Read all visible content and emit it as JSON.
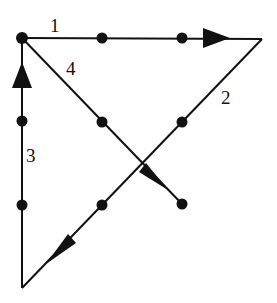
{
  "figure": {
    "canvas": {
      "width": 277,
      "height": 303,
      "background": "#ffffff"
    },
    "stroke_color": "#111111",
    "node_color": "#111111",
    "stroke_width": 2,
    "node_radius": 5.5,
    "vertices": [
      {
        "name": "top-left-vertex",
        "x": 22,
        "y": 38
      },
      {
        "name": "top-right-vertex",
        "x": 262,
        "y": 39
      },
      {
        "name": "bottom-left-vertex",
        "x": 22,
        "y": 288
      },
      {
        "name": "branch-end-vertex",
        "x": 182,
        "y": 204
      }
    ],
    "edges": [
      {
        "name": "edge-1-top",
        "label": "1",
        "from": {
          "x": 22,
          "y": 38
        },
        "to": {
          "x": 262,
          "y": 39
        },
        "direction": "right",
        "arrow_at": {
          "x": 228,
          "y": 38
        },
        "midpoints": [
          {
            "x": 102,
            "y": 38
          },
          {
            "x": 182,
            "y": 38
          }
        ],
        "label_pos": {
          "x": 50,
          "y": 16
        }
      },
      {
        "name": "edge-2-right-diagonal",
        "label": "2",
        "from": {
          "x": 262,
          "y": 39
        },
        "to": {
          "x": 22,
          "y": 288
        },
        "direction": "down-left",
        "arrow_at": {
          "x": 48,
          "y": 262
        },
        "midpoints": [
          {
            "x": 182,
            "y": 122
          },
          {
            "x": 102,
            "y": 205
          }
        ],
        "label_pos": {
          "x": 221,
          "y": 88
        }
      },
      {
        "name": "edge-3-left-vertical",
        "label": "3",
        "from": {
          "x": 22,
          "y": 288
        },
        "to": {
          "x": 22,
          "y": 38
        },
        "direction": "up",
        "arrow_at": {
          "x": 22,
          "y": 64
        },
        "midpoints": [
          {
            "x": 22,
            "y": 205
          },
          {
            "x": 22,
            "y": 121
          }
        ],
        "label_pos": {
          "x": 26,
          "y": 146
        }
      },
      {
        "name": "edge-4-branch-diagonal",
        "label": "4",
        "from": {
          "x": 22,
          "y": 38
        },
        "to": {
          "x": 182,
          "y": 204
        },
        "direction": "down-right",
        "arrow_at": {
          "x": 166,
          "y": 188
        },
        "midpoints": [
          {
            "x": 102,
            "y": 122
          }
        ],
        "label_pos": {
          "x": 66,
          "y": 59
        }
      }
    ],
    "nodes": [
      {
        "name": "node-top-left",
        "x": 22,
        "y": 38
      },
      {
        "name": "node-top-mid-1",
        "x": 102,
        "y": 38
      },
      {
        "name": "node-top-mid-2",
        "x": 182,
        "y": 38
      },
      {
        "name": "node-left-mid-1",
        "x": 22,
        "y": 121
      },
      {
        "name": "node-left-mid-2",
        "x": 22,
        "y": 205
      },
      {
        "name": "node-diag4-mid",
        "x": 102,
        "y": 122
      },
      {
        "name": "node-diag2-upper",
        "x": 182,
        "y": 122
      },
      {
        "name": "node-diag2-lower",
        "x": 102,
        "y": 205
      },
      {
        "name": "node-branch-end",
        "x": 182,
        "y": 204
      }
    ],
    "labels": [
      {
        "name": "edge-label-1",
        "text": "1",
        "x": 50,
        "y": 16
      },
      {
        "name": "edge-label-4",
        "text": "4",
        "x": 66,
        "y": 59
      },
      {
        "name": "edge-label-2",
        "text": "2",
        "x": 221,
        "y": 88
      },
      {
        "name": "edge-label-3",
        "text": "3",
        "x": 26,
        "y": 146
      }
    ]
  }
}
